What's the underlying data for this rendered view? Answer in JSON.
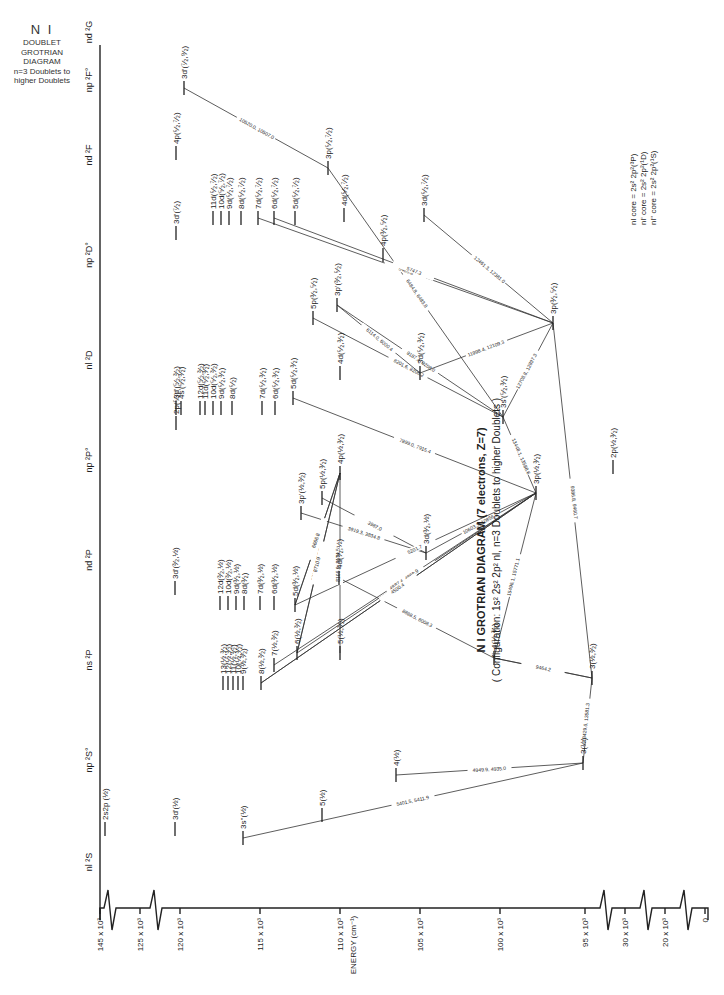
{
  "side_note": {
    "title": "N I",
    "lines": [
      "DOUBLET",
      "GROTRIAN",
      "DIAGRAM",
      "n=3 Doublets to",
      "higher Doublets"
    ]
  },
  "header": {
    "title": "N I GROTRIAN DIAGRAM (7 electrons, Z=7)",
    "subtitle": "( Configuration: 1s² 2s² 2p² nl,  n=3 Doublets to higher Doublets )"
  },
  "core_legend": [
    "nl core = 2s² 2p²(³P)",
    "nl' core = 2s² 2p²(¹D)",
    "nl'' core = 2s² 2p²(¹S)"
  ],
  "columns": [
    {
      "label": "nl ²S",
      "x": 95,
      "y": 862
    },
    {
      "label": "np ²S°",
      "x": 95,
      "y": 760
    },
    {
      "label": "ns ²P",
      "x": 95,
      "y": 660
    },
    {
      "label": "nd ²P",
      "x": 95,
      "y": 560
    },
    {
      "label": "np ²P°",
      "x": 95,
      "y": 460
    },
    {
      "label": "nl ²D",
      "x": 95,
      "y": 360
    },
    {
      "label": "np ²D°",
      "x": 95,
      "y": 255
    },
    {
      "label": "nd ²F",
      "x": 95,
      "y": 155
    },
    {
      "label": "np ²F°",
      "x": 95,
      "y": 80
    },
    {
      "label": "nd ²G",
      "x": 95,
      "y": 32
    }
  ],
  "energy_axis": {
    "label": "ENERGY (cm⁻¹)",
    "ticks": [
      {
        "label": "145 x 10³",
        "x": 100
      },
      {
        "label": "125 x 10³",
        "x": 140
      },
      {
        "label": "120 x 10³",
        "x": 180
      },
      {
        "label": "115 x 10³",
        "x": 260
      },
      {
        "label": "110 x 10³",
        "x": 340
      },
      {
        "label": "105 x 10³",
        "x": 420
      },
      {
        "label": "100 x 10³",
        "x": 500
      },
      {
        "label": "95 x 10³",
        "x": 585
      },
      {
        "label": "30 x 10³",
        "x": 625
      },
      {
        "label": "20 x 10³",
        "x": 665
      },
      {
        "label": "0",
        "x": 705
      }
    ]
  },
  "levels": [
    {
      "id": "2s2p",
      "label": "2s2p (½)",
      "x": 105,
      "y": 836
    },
    {
      "id": "3d1_S",
      "label": "3d'(½)",
      "x": 175,
      "y": 836
    },
    {
      "id": "3s2",
      "label": "3s''(½)",
      "x": 243,
      "y": 845
    },
    {
      "id": "5s",
      "label": "5(½)",
      "x": 322,
      "y": 822
    },
    {
      "id": "4s",
      "label": "4(½)",
      "x": 396,
      "y": 782
    },
    {
      "id": "3s",
      "label": "3(½)",
      "x": 583,
      "y": 770
    },
    {
      "id": "3s_P",
      "label": "3(½,³⁄₂)",
      "x": 592,
      "y": 685
    },
    {
      "id": "4s_P",
      "label": "4(½,³⁄₂)",
      "x": 494,
      "y": 665
    },
    {
      "id": "5s_P",
      "label": "5(½,³⁄₂)",
      "x": 340,
      "y": 660
    },
    {
      "id": "6s_P",
      "label": "6(½,³⁄₂)",
      "x": 297,
      "y": 660
    },
    {
      "id": "7s_P",
      "label": "7(½,³⁄₂)",
      "x": 274,
      "y": 672
    },
    {
      "id": "8s_P",
      "label": "8(½,³⁄₂)",
      "x": 261,
      "y": 690
    },
    {
      "id": "9s_P",
      "label": "9(½,³⁄₂)",
      "x": 243,
      "y": 690
    },
    {
      "id": "10s_P",
      "label": "10(½,³⁄₂)",
      "x": 238,
      "y": 690
    },
    {
      "id": "11s_P",
      "label": "11(½,³⁄₂)",
      "x": 233,
      "y": 690
    },
    {
      "id": "12s_P",
      "label": "12(½,³⁄₂)",
      "x": 228,
      "y": 690
    },
    {
      "id": "13s_P",
      "label": "13(½,³⁄₂)",
      "x": 223,
      "y": 690
    },
    {
      "id": "3d1_P",
      "label": "3d'(³⁄₂,½)",
      "x": 175,
      "y": 595
    },
    {
      "id": "12d_P",
      "label": "12d(³⁄₂,½)",
      "x": 220,
      "y": 610
    },
    {
      "id": "10d_P",
      "label": "10d(³⁄₂,½)",
      "x": 228,
      "y": 610
    },
    {
      "id": "9d_P",
      "label": "9d(³⁄₂,½)",
      "x": 236,
      "y": 610
    },
    {
      "id": "8d_P",
      "label": "8d(³⁄₂)",
      "x": 244,
      "y": 610
    },
    {
      "id": "7d_P",
      "label": "7d(³⁄₂,½)",
      "x": 260,
      "y": 610
    },
    {
      "id": "6d_P",
      "label": "6d(³⁄₂,½)",
      "x": 274,
      "y": 610
    },
    {
      "id": "5d_P",
      "label": "5d(³⁄₂,½)",
      "x": 295,
      "y": 612
    },
    {
      "id": "4d_P",
      "label": "4d(³⁄₂,½)",
      "x": 339,
      "y": 585
    },
    {
      "id": "3d_P",
      "label": "3d(³⁄₂,½)",
      "x": 426,
      "y": 560
    },
    {
      "id": "3p1_P",
      "label": "3p'(½,³⁄₂)",
      "x": 301,
      "y": 520
    },
    {
      "id": "5p_P",
      "label": "5p(½,³⁄₂)",
      "x": 322,
      "y": 505
    },
    {
      "id": "4p_P",
      "label": "4p(½,³⁄₂)",
      "x": 340,
      "y": 480
    },
    {
      "id": "3p_P",
      "label": "3p(½,³⁄₂)",
      "x": 536,
      "y": 500
    },
    {
      "id": "2p_P",
      "label": "2p(½,³⁄₂)",
      "x": 613,
      "y": 474
    },
    {
      "id": "2p_D",
      "label": "2p(⁵⁄₂)",
      "x": 176,
      "y": 430
    },
    {
      "id": "3d1_D",
      "label": "3d'(⁵⁄₂,³⁄₂)",
      "x": 176,
      "y": 415
    },
    {
      "id": "4s1_D",
      "label": "4s'(⁵⁄₂,³⁄₂)",
      "x": 181,
      "y": 415
    },
    {
      "id": "12d_D",
      "label": "12d(⁵⁄₂,³⁄₂)",
      "x": 200,
      "y": 415
    },
    {
      "id": "11d_D",
      "label": "11d(⁵⁄₂,³⁄₂)",
      "x": 205,
      "y": 415
    },
    {
      "id": "10d_D",
      "label": "10d(⁵⁄₂,³⁄₂)",
      "x": 213,
      "y": 415
    },
    {
      "id": "9d_D",
      "label": "9d(⁵⁄₂,³⁄₂)",
      "x": 221,
      "y": 415
    },
    {
      "id": "8d_D",
      "label": "8d(⁵⁄₂)",
      "x": 232,
      "y": 415
    },
    {
      "id": "7d_D",
      "label": "7d(⁵⁄₂,³⁄₂)",
      "x": 262,
      "y": 415
    },
    {
      "id": "6d_D",
      "label": "6d(⁵⁄₂,³⁄₂)",
      "x": 275,
      "y": 415
    },
    {
      "id": "5d_D",
      "label": "5d(⁵⁄₂,³⁄₂)",
      "x": 293,
      "y": 405
    },
    {
      "id": "4d_D",
      "label": "4d(⁵⁄₂,³⁄₂)",
      "x": 340,
      "y": 380
    },
    {
      "id": "3d_D",
      "label": "3d(⁵⁄₂,³⁄₂)",
      "x": 420,
      "y": 380
    },
    {
      "id": "3s1_D",
      "label": "3s'(⁵⁄₂,³⁄₂)",
      "x": 503,
      "y": 424
    },
    {
      "id": "5p_D",
      "label": "5p(³⁄₂,⁵⁄₂)",
      "x": 313,
      "y": 325
    },
    {
      "id": "3p1_D",
      "label": "3p'(³⁄₂,⁵⁄₂)",
      "x": 337,
      "y": 312
    },
    {
      "id": "4p_D",
      "label": "4p(³⁄₂,⁵⁄₂)",
      "x": 383,
      "y": 262
    },
    {
      "id": "3p_D",
      "label": "3p(³⁄₂,⁵⁄₂)",
      "x": 553,
      "y": 330
    },
    {
      "id": "3d1_F",
      "label": "3d'(⁷⁄₂)",
      "x": 176,
      "y": 240
    },
    {
      "id": "11d_F",
      "label": "11d(⁵⁄₂,⁷⁄₂)",
      "x": 213,
      "y": 225
    },
    {
      "id": "10d_F",
      "label": "10d(⁵⁄₂,⁷⁄₂)",
      "x": 221,
      "y": 225
    },
    {
      "id": "9d_F",
      "label": "9d(⁵⁄₂,⁷⁄₂)",
      "x": 229,
      "y": 225
    },
    {
      "id": "8d_F",
      "label": "8d(⁵⁄₂,⁷⁄₂)",
      "x": 241,
      "y": 225
    },
    {
      "id": "7d_F",
      "label": "7d(⁵⁄₂,⁷⁄₂)",
      "x": 258,
      "y": 225
    },
    {
      "id": "6d_F",
      "label": "6d(⁵⁄₂,⁷⁄₂)",
      "x": 274,
      "y": 225
    },
    {
      "id": "5d_F",
      "label": "5d(⁵⁄₂,⁷⁄₂)",
      "x": 295,
      "y": 225
    },
    {
      "id": "4d_F",
      "label": "4d(⁵⁄₂,⁷⁄₂)",
      "x": 344,
      "y": 222
    },
    {
      "id": "3d_F",
      "label": "3d(⁵⁄₂,⁷⁄₂)",
      "x": 424,
      "y": 222
    },
    {
      "id": "4p_F",
      "label": "4p(⁵⁄₂,⁷⁄₂)",
      "x": 176,
      "y": 160
    },
    {
      "id": "3p_F",
      "label": "3p(⁵⁄₂,⁷⁄₂)",
      "x": 328,
      "y": 175
    },
    {
      "id": "3d1_G",
      "label": "3d'(⁷⁄₂,⁹⁄₂)",
      "x": 184,
      "y": 95
    }
  ],
  "transitions": [
    {
      "from": "3d1_G",
      "to": "3p_F",
      "label": "10520.0, 10507.0"
    },
    {
      "from": "3p_F",
      "to": "3s1_D",
      "label": "6484.8, 6483.8"
    },
    {
      "from": "7d_F",
      "to": "3p_D",
      "label": "5485.8"
    },
    {
      "from": "6d_F",
      "to": "3p_D",
      "label": "5747.3"
    },
    {
      "from": "3d_F",
      "to": "3p_D",
      "label": "12461.3, 12381.0"
    },
    {
      "from": "5p_D",
      "to": "3s1_D",
      "label": "8201.6, 8206.2"
    },
    {
      "from": "3p1_D",
      "to": "3s1_D",
      "label": "9187.4, 9208.0"
    },
    {
      "from": "3p1_D",
      "to": "3d_D",
      "label": "6114.0, 6000.4"
    },
    {
      "from": "3d_D",
      "to": "3p_D",
      "label": "11998.4, 12109.3"
    },
    {
      "from": "3s1_D",
      "to": "3p_D",
      "label": "12708.8, 12897.3"
    },
    {
      "from": "3s1_D",
      "to": "3p_P",
      "label": "13448.1, 13588.6"
    },
    {
      "from": "3p_D",
      "to": "3s_P",
      "label": "9386.8, 9460.7"
    },
    {
      "from": "3d_P",
      "to": "3p_P",
      "label": "10603.3, 10856.9"
    },
    {
      "from": "5d_D",
      "to": "3p_P",
      "label": "7899.0, 7915.4"
    },
    {
      "from": "3p1_P",
      "to": "3d_P",
      "label": "3919.3, 3834.8"
    },
    {
      "from": "5p_P",
      "to": "3d_P",
      "label": "3987.0"
    },
    {
      "from": "5d_P",
      "to": "4p_P",
      "label": "6272.8"
    },
    {
      "from": "5d_P",
      "to": "4p_P",
      "label": "6666.8"
    },
    {
      "from": "5d_P",
      "to": "3p_P",
      "label": "5201.7"
    },
    {
      "from": "4d_P",
      "to": "4s_P",
      "label": "8888.5, 8008.3"
    },
    {
      "from": "6s_P",
      "to": "4p_P",
      "label": "5764.9, 6117.7"
    },
    {
      "from": "6s_P",
      "to": "4p_P",
      "label": "8710.9"
    },
    {
      "from": "5s_P",
      "to": "4p_P",
      "label": "8105.6, 8174.5"
    },
    {
      "from": "6s_P",
      "to": "3p_P",
      "label": "5219.0"
    },
    {
      "from": "7s_P",
      "to": "3p_P",
      "label": "4887.4, 4869.9"
    },
    {
      "from": "8s_P",
      "to": "3p_P",
      "label": "4675.4"
    },
    {
      "from": "8s_P",
      "to": "3p_P",
      "label": "4500.4"
    },
    {
      "from": "4s_P",
      "to": "3p_P",
      "label": "15496.1, 15771.1"
    },
    {
      "from": "4s_P",
      "to": "3s_P",
      "label": "10906.3, 9870.0"
    },
    {
      "from": "4s_P",
      "to": "3s_P",
      "label": "9464.2"
    },
    {
      "from": "3s",
      "to": "3s_P",
      "label": "13429.6, 13581.3"
    },
    {
      "from": "4s",
      "to": "3s",
      "label": "4949.9, 4935.0"
    },
    {
      "from": "3s2",
      "to": "3s",
      "label": "5401.5, 5411.9"
    }
  ],
  "chart_data": {
    "type": "grotrian",
    "title": "N I GROTRIAN DIAGRAM (7 electrons, Z=7)",
    "subtitle": "Configuration: 1s² 2s² 2p² nl, n=3 Doublets to higher Doublets",
    "xlabel": "ENERGY (cm⁻¹)",
    "energy_ticks": [
      "0",
      "20 x 10³",
      "30 x 10³",
      "95 x 10³",
      "100 x 10³",
      "105 x 10³",
      "110 x 10³",
      "115 x 10³",
      "120 x 10³",
      "125 x 10³",
      "145 x 10³"
    ],
    "term_columns": [
      "nl ²S",
      "np ²S°",
      "ns ²P",
      "nd ²P",
      "np ²P°",
      "nl ²D",
      "np ²D°",
      "nd ²F",
      "np ²F°",
      "nd ²G"
    ],
    "wavelength_labels_angstrom": [
      "10520.0, 10507.0",
      "6484.8, 6483.8",
      "5485.8",
      "5747.3",
      "12461.3, 12381.0",
      "8201.6, 8206.2",
      "9187.4, 9208.0",
      "6114.0, 6000.4",
      "11998.4, 12109.3",
      "12708.8, 12897.3",
      "13448.1, 13588.6",
      "9386.8, 9460.7",
      "10603.3, 10856.9",
      "7899.0, 7915.4",
      "3919.3, 3834.8",
      "3987.0",
      "6272.8",
      "6666.8",
      "5201.7",
      "8888.5, 8008.3",
      "5764.9, 6117.7",
      "8710.9",
      "8105.6, 8174.5",
      "5219.0",
      "4887.4, 4869.9",
      "4675.4",
      "4500.4",
      "15496.1, 15771.1",
      "10906.3, 9870.0",
      "9464.2",
      "13429.6, 13581.3",
      "4949.9, 4935.0",
      "5401.5, 5411.9"
    ]
  }
}
